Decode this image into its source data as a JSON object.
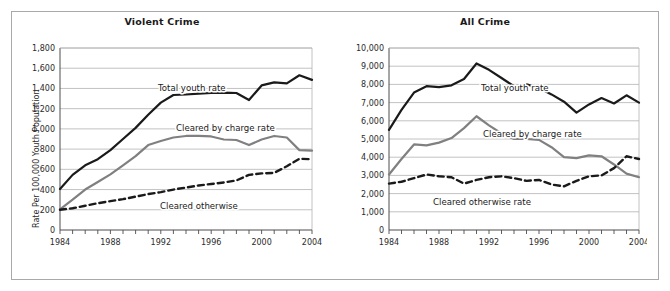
{
  "figure": {
    "background": "#ffffff",
    "border_color": "#a9a9a9"
  },
  "colors": {
    "total_youth": "#1a1a1a",
    "cleared_by_charge": "#808080",
    "cleared_otherwise": "#1a1a1a",
    "gridline": "#b3b3b3",
    "axis": "#4d4d4d",
    "text": "#2b2b2b"
  },
  "chart_data": [
    {
      "type": "line",
      "title": "Violent Crime",
      "xlabel": "",
      "ylabel": "Rate Per 100,000 Youth Population",
      "xlim": [
        1984,
        2004
      ],
      "ylim": [
        0,
        1800
      ],
      "grid": true,
      "legend_position": "inline-annotations",
      "xticks": [
        1984,
        1988,
        1992,
        1996,
        2000,
        2004
      ],
      "xtick_labels": [
        "1984",
        "1988",
        "1992",
        "1996",
        "2000",
        "2004"
      ],
      "minor_xticks_every": 1,
      "yticks": [
        0,
        200,
        400,
        600,
        800,
        1000,
        1200,
        1400,
        1600,
        1800
      ],
      "ytick_labels": [
        "0",
        "200",
        "400",
        "600",
        "800",
        "1,000",
        "1,200",
        "1,400",
        "1,600",
        "1,800"
      ],
      "x": [
        1984,
        1985,
        1986,
        1987,
        1988,
        1989,
        1990,
        1991,
        1992,
        1993,
        1994,
        1995,
        1996,
        1997,
        1998,
        1999,
        2000,
        2001,
        2002,
        2003,
        2004
      ],
      "series": [
        {
          "name": "Total youth rate",
          "style": "solid-thick",
          "color": "#1a1a1a",
          "values": [
            405,
            545,
            640,
            700,
            790,
            900,
            1010,
            1140,
            1260,
            1335,
            1340,
            1348,
            1355,
            1358,
            1355,
            1285,
            1430,
            1460,
            1450,
            1530,
            1485
          ],
          "label_text": "Total youth rate"
        },
        {
          "name": "Cleared by charge rate",
          "style": "solid-thick",
          "color": "#808080",
          "values": [
            205,
            300,
            400,
            475,
            550,
            640,
            730,
            840,
            880,
            915,
            930,
            930,
            925,
            895,
            890,
            840,
            895,
            930,
            915,
            790,
            785
          ],
          "label_text": "Cleared by charge rate"
        },
        {
          "name": "Cleared otherwise",
          "style": "dashed-thick",
          "color": "#1a1a1a",
          "values": [
            200,
            215,
            240,
            265,
            285,
            305,
            330,
            355,
            375,
            400,
            420,
            440,
            455,
            470,
            490,
            545,
            560,
            565,
            630,
            705,
            700
          ],
          "label_text": "Cleared otherwise"
        }
      ]
    },
    {
      "type": "line",
      "title": "All Crime",
      "xlabel": "",
      "ylabel": "Rate Per 100,000 Youth Population",
      "xlim": [
        1984,
        2004
      ],
      "ylim": [
        0,
        10000
      ],
      "grid": true,
      "legend_position": "inline-annotations",
      "xticks": [
        1984,
        1988,
        1992,
        1996,
        2000,
        2004
      ],
      "xtick_labels": [
        "1984",
        "1988",
        "1992",
        "1996",
        "2000",
        "2004"
      ],
      "minor_xticks_every": 1,
      "yticks": [
        0,
        1000,
        2000,
        3000,
        4000,
        5000,
        6000,
        7000,
        8000,
        9000,
        10000
      ],
      "ytick_labels": [
        "0",
        "1,000",
        "2,000",
        "3,000",
        "4,000",
        "5,000",
        "6,000",
        "7,000",
        "8,000",
        "9,000",
        "10,000"
      ],
      "x": [
        1984,
        1985,
        1986,
        1987,
        1988,
        1989,
        1990,
        1991,
        1992,
        1993,
        1994,
        1995,
        1996,
        1997,
        1998,
        1999,
        2000,
        2001,
        2002,
        2003,
        2004
      ],
      "series": [
        {
          "name": "Total youth rate",
          "style": "solid-thick",
          "color": "#1a1a1a",
          "values": [
            5500,
            6600,
            7550,
            7900,
            7850,
            7950,
            8300,
            9150,
            8800,
            8350,
            7900,
            8000,
            7800,
            7450,
            7050,
            6450,
            6900,
            7250,
            6950,
            7400,
            7000
          ],
          "label_text": "Total youth rate"
        },
        {
          "name": "Cleared by charge rate",
          "style": "solid-thick",
          "color": "#808080",
          "values": [
            3050,
            3900,
            4700,
            4650,
            4800,
            5050,
            5600,
            6250,
            5750,
            5300,
            5000,
            5000,
            4950,
            4550,
            4000,
            3950,
            4100,
            4050,
            3600,
            3100,
            2900
          ],
          "label_text": "Cleared by charge rate"
        },
        {
          "name": "Cleared otherwise rate",
          "style": "dashed-thick",
          "color": "#1a1a1a",
          "values": [
            2550,
            2650,
            2850,
            3050,
            2950,
            2900,
            2550,
            2750,
            2900,
            2950,
            2850,
            2700,
            2750,
            2500,
            2400,
            2700,
            2950,
            3000,
            3400,
            4050,
            3900
          ],
          "label_text": "Cleared otherwise rate"
        }
      ]
    }
  ]
}
